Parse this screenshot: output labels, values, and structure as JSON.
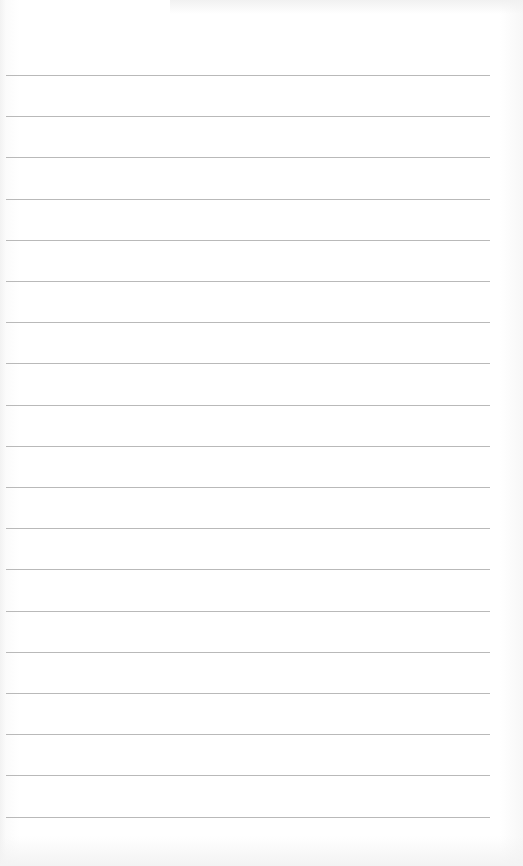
{
  "page": {
    "type": "lined-paper",
    "background_color": "#ffffff",
    "rule_color": "#b9b9b9",
    "rule_count": 19,
    "first_rule_y": 75,
    "rule_spacing": 41.2,
    "rule_left": 6,
    "rule_width": 484
  }
}
